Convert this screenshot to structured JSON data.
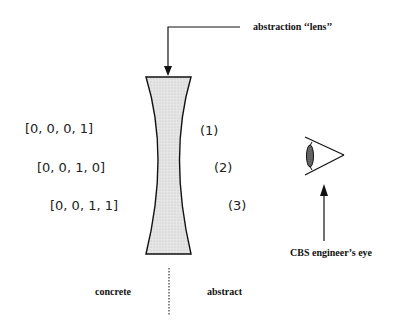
{
  "diagram": {
    "lens_label": "abstraction ‘‘lens’’",
    "vectors": [
      {
        "text": "[0, 0, 0, 1]",
        "index": "(1)"
      },
      {
        "text": "[0, 0, 1, 0]",
        "index": "(2)"
      },
      {
        "text": "[0, 0, 1, 1]",
        "index": "(3)"
      }
    ],
    "eye_label": "CBS engineer’s eye",
    "left_side_label": "concrete",
    "right_side_label": "abstract",
    "icons": {
      "lens": "concave-lens-icon",
      "eye": "eye-icon"
    },
    "colors": {
      "stroke": "#111111",
      "lens_fill": "#dcdcdc"
    }
  }
}
